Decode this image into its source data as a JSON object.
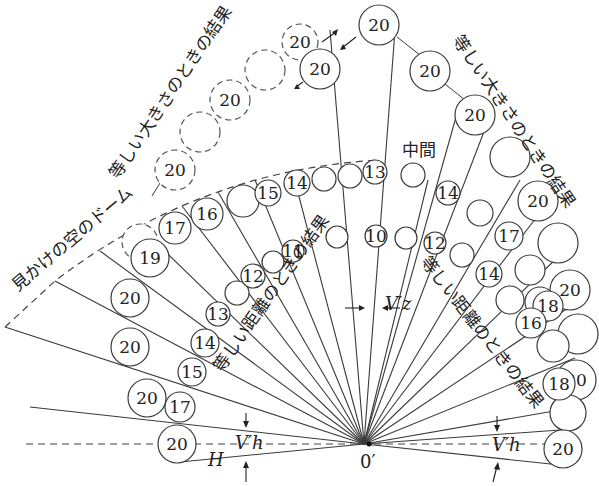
{
  "diagram": {
    "labels": {
      "apparent_dome": "見かけの空のドーム",
      "equal_size_left": "等しい大きさのときの結果",
      "equal_size_right": "等しい大きさのときの結果",
      "equal_distance_left": "等しい距離のときの結果",
      "equal_distance_right": "等しい距離のときの結果",
      "middle": "中間",
      "origin": "0′",
      "vz": "V′z",
      "vh_left": "V′h",
      "vh_right": "V′h",
      "h": "H"
    },
    "circles": {
      "top": "20",
      "equal_size_left_dashed": [
        "20",
        "20",
        "20"
      ],
      "equal_size_left_solid": "20",
      "equal_size_right": [
        "20",
        "20",
        "20",
        "20",
        "20",
        "20"
      ],
      "outer_left": [
        "19",
        "20",
        "20",
        "20",
        "20"
      ],
      "middle_arc": [
        "17",
        "16",
        "15",
        "14",
        "13",
        "14",
        "17",
        "16",
        "18"
      ],
      "equal_distance_inner": [
        "17",
        "15",
        "14",
        "13",
        "12",
        "11",
        "10",
        "12",
        "14",
        "18"
      ]
    }
  }
}
